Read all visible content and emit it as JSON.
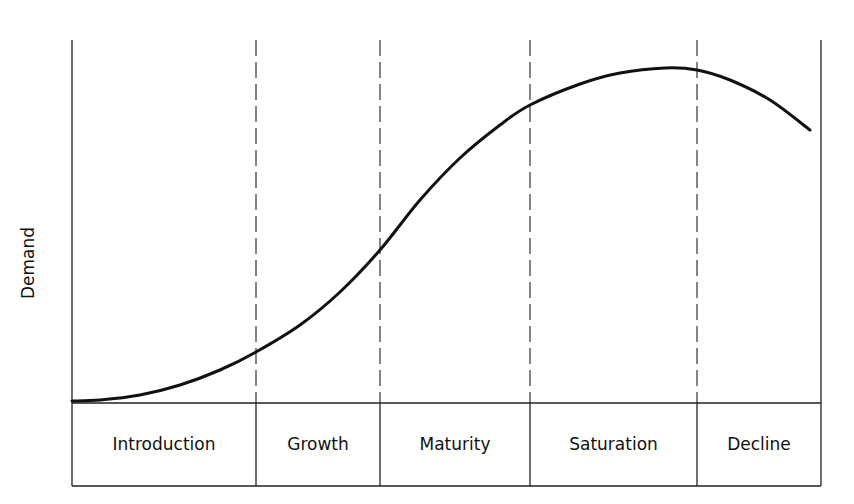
{
  "chart_data": {
    "type": "line",
    "title": "",
    "xlabel": "",
    "ylabel": "Demand",
    "grid": false,
    "stages": [
      "Introduction",
      "Growth",
      "Maturity",
      "Saturation",
      "Decline"
    ],
    "stage_boundaries_px": [
      72,
      256,
      380,
      530,
      697,
      821
    ],
    "series": [
      {
        "name": "Demand",
        "points_px": [
          [
            72,
            401
          ],
          [
            100,
            400
          ],
          [
            140,
            395
          ],
          [
            180,
            385
          ],
          [
            220,
            370
          ],
          [
            256,
            352
          ],
          [
            300,
            325
          ],
          [
            340,
            292
          ],
          [
            380,
            250
          ],
          [
            420,
            200
          ],
          [
            460,
            158
          ],
          [
            500,
            125
          ],
          [
            530,
            105
          ],
          [
            580,
            84
          ],
          [
            620,
            73
          ],
          [
            665,
            68
          ],
          [
            697,
            70
          ],
          [
            730,
            80
          ],
          [
            770,
            100
          ],
          [
            810,
            130
          ]
        ],
        "relative_values": {
          "x_stage_boundaries": [
            0,
            0.246,
            0.411,
            0.611,
            0.834,
            1.0
          ],
          "y_at_boundaries": [
            0.0,
            0.14,
            0.42,
            0.82,
            0.92,
            0.75
          ]
        }
      }
    ],
    "annotations": [
      "Dashed vertical lines separate lifecycle stages"
    ]
  },
  "labels": {
    "ylabel": "Demand",
    "stages": [
      "Introduction",
      "Growth",
      "Maturity",
      "Saturation",
      "Decline"
    ]
  },
  "colors": {
    "line": "#111111",
    "background": "#ffffff"
  }
}
